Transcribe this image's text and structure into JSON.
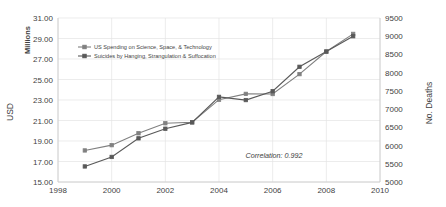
{
  "chart_data": {
    "type": "line",
    "title": "",
    "xlabel": "",
    "ylabel": "USD",
    "y_unit": "Millions",
    "y2label": "No. Deaths",
    "xlim": [
      1998,
      2010
    ],
    "ylim": [
      15.0,
      31.0
    ],
    "y2lim": [
      5000,
      9500
    ],
    "x_ticks": [
      "1998",
      "2000",
      "2002",
      "2004",
      "2006",
      "2008",
      "2010"
    ],
    "x_tick_values": [
      1998,
      2000,
      2002,
      2004,
      2006,
      2008,
      2010
    ],
    "y_ticks": [
      "15.00",
      "17.00",
      "19.00",
      "21.00",
      "23.00",
      "25.00",
      "27.00",
      "29.00",
      "31.00"
    ],
    "y_tick_values": [
      15.0,
      17.0,
      19.0,
      21.0,
      23.0,
      25.0,
      27.0,
      29.0,
      31.0
    ],
    "y2_ticks": [
      "5000",
      "5500",
      "6000",
      "6500",
      "7000",
      "7500",
      "8000",
      "8500",
      "9000",
      "9500"
    ],
    "y2_tick_values": [
      5000,
      5500,
      6000,
      6500,
      7000,
      7500,
      8000,
      8500,
      9000,
      9500
    ],
    "grid": true,
    "legend_position": "upper-left-inside",
    "x": [
      1999,
      2000,
      2001,
      2002,
      2003,
      2004,
      2005,
      2006,
      2007,
      2008,
      2009
    ],
    "series": [
      {
        "name": "US Spending on Science, Space, & Technology",
        "axis": "left",
        "color": "#808080",
        "marker": "square",
        "values": [
          18.079,
          18.594,
          19.753,
          20.734,
          20.831,
          23.029,
          23.597,
          23.584,
          25.525,
          27.731,
          29.449
        ]
      },
      {
        "name": "Suicides by Hanging, Strangulation & Suffocation",
        "axis": "right",
        "color": "#595959",
        "marker": "square",
        "values": [
          5427,
          5688,
          6198,
          6462,
          6635,
          7336,
          7248,
          7491,
          8161,
          8578,
          9000
        ]
      }
    ],
    "annotations": [
      {
        "text": "Correlation: 0.992",
        "x": 2006.05,
        "y": 17.35
      }
    ]
  },
  "legend": {
    "items": [
      {
        "label": "US Spending on Science, Space, & Technology"
      },
      {
        "label": "Suicides by Hanging, Strangulation & Suffocation"
      }
    ]
  },
  "axes": {
    "left_unit": "Millions",
    "left_title": "USD",
    "right_title": "No. Deaths"
  }
}
